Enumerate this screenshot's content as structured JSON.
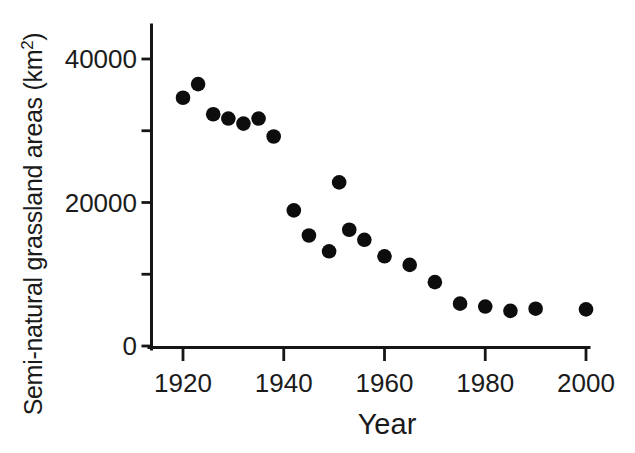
{
  "figure": {
    "background_color": "#ffffff",
    "ink_color": "#161616"
  },
  "chart_data": {
    "type": "scatter",
    "title": "",
    "xlabel": "Year",
    "ylabel": "Semi-natural grassland areas (km²)",
    "ylabel_parts": {
      "base": "Semi-natural grassland areas (km",
      "sup": "2",
      "close": ")"
    },
    "xlim": [
      1913,
      2001
    ],
    "ylim": [
      0,
      45000
    ],
    "x_ticks": [
      1920,
      1940,
      1960,
      1980,
      2000
    ],
    "x_tick_labels": [
      "1920",
      "1940",
      "1960",
      "1980",
      "2000"
    ],
    "y_ticks": [
      0,
      10000,
      20000,
      30000,
      40000
    ],
    "y_tick_labels": [
      "0",
      "",
      "20000",
      "",
      "40000"
    ],
    "grid": false,
    "legend": null,
    "marker": {
      "shape": "circle",
      "color": "#0d0d0d",
      "radius": 7.3
    },
    "units": "km2",
    "points": [
      {
        "year": 1920,
        "area_km2": 34600
      },
      {
        "year": 1923,
        "area_km2": 36500
      },
      {
        "year": 1926,
        "area_km2": 32300
      },
      {
        "year": 1929,
        "area_km2": 31700
      },
      {
        "year": 1932,
        "area_km2": 31000
      },
      {
        "year": 1935,
        "area_km2": 31700
      },
      {
        "year": 1938,
        "area_km2": 29200
      },
      {
        "year": 1942,
        "area_km2": 18900
      },
      {
        "year": 1945,
        "area_km2": 15400
      },
      {
        "year": 1949,
        "area_km2": 13200
      },
      {
        "year": 1951,
        "area_km2": 22800
      },
      {
        "year": 1953,
        "area_km2": 16200
      },
      {
        "year": 1956,
        "area_km2": 14800
      },
      {
        "year": 1960,
        "area_km2": 12500
      },
      {
        "year": 1965,
        "area_km2": 11300
      },
      {
        "year": 1970,
        "area_km2": 8900
      },
      {
        "year": 1975,
        "area_km2": 5900
      },
      {
        "year": 1980,
        "area_km2": 5500
      },
      {
        "year": 1985,
        "area_km2": 4900
      },
      {
        "year": 1990,
        "area_km2": 5200
      },
      {
        "year": 2000,
        "area_km2": 5100
      }
    ]
  }
}
